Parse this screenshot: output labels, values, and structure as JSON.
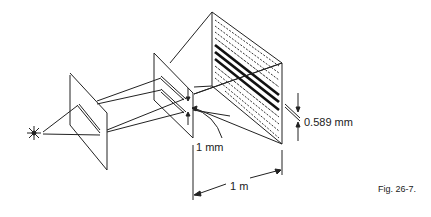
{
  "figure": {
    "caption": "Fig. 26-7.",
    "labels": {
      "slit_separation": "1 mm",
      "screen_distance": "1 m",
      "fringe_spacing": "0.589 mm"
    },
    "components": [
      {
        "name": "light-source",
        "symbol": "star"
      },
      {
        "name": "single-slit-screen"
      },
      {
        "name": "double-slit-screen"
      },
      {
        "name": "observation-screen",
        "content": "interference fringes"
      }
    ],
    "colors": {
      "line": "#222222",
      "background": "#ffffff"
    }
  }
}
